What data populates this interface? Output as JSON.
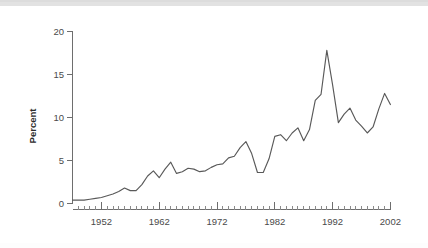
{
  "figure": {
    "background_color": "#ffffff",
    "top_strip_color": "#e2e2e2",
    "line_color": "#595959",
    "axis_color": "#6e6e6e",
    "text_color": "#4a4a4a"
  },
  "axis": {
    "ylabel": "Percent",
    "yticks": [
      "0",
      "5",
      "10",
      "15",
      "20"
    ],
    "xticks": [
      "1952",
      "1962",
      "1972",
      "1982",
      "1992",
      "2002"
    ]
  },
  "chart_data": {
    "type": "line",
    "title": "",
    "xlabel": "",
    "ylabel": "Percent",
    "xlim": [
      1947,
      2002
    ],
    "ylim": [
      0,
      20
    ],
    "yticks": [
      0,
      5,
      10,
      15,
      20
    ],
    "xticks": [
      1952,
      1962,
      1972,
      1982,
      1992,
      2002
    ],
    "minor_xtick_interval": 1,
    "grid": false,
    "legend": "none",
    "x": [
      1947,
      1948,
      1949,
      1950,
      1951,
      1952,
      1953,
      1954,
      1955,
      1956,
      1957,
      1958,
      1959,
      1960,
      1961,
      1962,
      1963,
      1964,
      1965,
      1966,
      1967,
      1968,
      1969,
      1970,
      1971,
      1972,
      1973,
      1974,
      1975,
      1976,
      1977,
      1978,
      1979,
      1980,
      1981,
      1982,
      1983,
      1984,
      1985,
      1986,
      1987,
      1988,
      1989,
      1990,
      1991,
      1992,
      1993,
      1994,
      1995,
      1996,
      1997,
      1998,
      1999,
      2000,
      2001,
      2002
    ],
    "values": [
      0.4,
      0.4,
      0.4,
      0.5,
      0.6,
      0.7,
      0.9,
      1.1,
      1.4,
      1.8,
      1.5,
      1.5,
      2.2,
      3.2,
      3.8,
      3.0,
      4.0,
      4.8,
      3.5,
      3.7,
      4.1,
      4.0,
      3.7,
      3.8,
      4.2,
      4.5,
      4.6,
      5.3,
      5.5,
      6.5,
      7.2,
      5.8,
      3.6,
      3.6,
      5.2,
      7.8,
      8.0,
      7.3,
      8.2,
      8.8,
      7.3,
      8.6,
      12.0,
      12.7,
      17.8,
      13.8,
      9.4,
      10.4,
      11.1,
      9.7,
      9.0,
      8.2,
      8.9,
      11.0,
      12.8,
      11.5
    ],
    "series": [
      {
        "name": "Percent",
        "points": [
          {
            "x": 1947,
            "y": 0.4
          },
          {
            "x": 1948,
            "y": 0.4
          },
          {
            "x": 1949,
            "y": 0.4
          },
          {
            "x": 1950,
            "y": 0.5
          },
          {
            "x": 1951,
            "y": 0.6
          },
          {
            "x": 1952,
            "y": 0.7
          },
          {
            "x": 1953,
            "y": 0.9
          },
          {
            "x": 1954,
            "y": 1.1
          },
          {
            "x": 1955,
            "y": 1.4
          },
          {
            "x": 1956,
            "y": 1.8
          },
          {
            "x": 1957,
            "y": 1.5
          },
          {
            "x": 1958,
            "y": 1.5
          },
          {
            "x": 1959,
            "y": 2.2
          },
          {
            "x": 1960,
            "y": 3.2
          },
          {
            "x": 1961,
            "y": 3.8
          },
          {
            "x": 1962,
            "y": 3.0
          },
          {
            "x": 1963,
            "y": 4.0
          },
          {
            "x": 1964,
            "y": 4.8
          },
          {
            "x": 1965,
            "y": 3.5
          },
          {
            "x": 1966,
            "y": 3.7
          },
          {
            "x": 1967,
            "y": 4.1
          },
          {
            "x": 1968,
            "y": 4.0
          },
          {
            "x": 1969,
            "y": 3.7
          },
          {
            "x": 1970,
            "y": 3.8
          },
          {
            "x": 1971,
            "y": 4.2
          },
          {
            "x": 1972,
            "y": 4.5
          },
          {
            "x": 1973,
            "y": 4.6
          },
          {
            "x": 1974,
            "y": 5.3
          },
          {
            "x": 1975,
            "y": 5.5
          },
          {
            "x": 1976,
            "y": 6.5
          },
          {
            "x": 1977,
            "y": 7.2
          },
          {
            "x": 1978,
            "y": 5.8
          },
          {
            "x": 1979,
            "y": 3.6
          },
          {
            "x": 1980,
            "y": 3.6
          },
          {
            "x": 1981,
            "y": 5.2
          },
          {
            "x": 1982,
            "y": 7.8
          },
          {
            "x": 1983,
            "y": 8.0
          },
          {
            "x": 1984,
            "y": 7.3
          },
          {
            "x": 1985,
            "y": 8.2
          },
          {
            "x": 1986,
            "y": 8.8
          },
          {
            "x": 1987,
            "y": 7.3
          },
          {
            "x": 1988,
            "y": 8.6
          },
          {
            "x": 1989,
            "y": 12.0
          },
          {
            "x": 1990,
            "y": 12.7
          },
          {
            "x": 1991,
            "y": 17.8
          },
          {
            "x": 1992,
            "y": 13.8
          },
          {
            "x": 1993,
            "y": 9.4
          },
          {
            "x": 1994,
            "y": 10.4
          },
          {
            "x": 1995,
            "y": 11.1
          },
          {
            "x": 1996,
            "y": 9.7
          },
          {
            "x": 1997,
            "y": 9.0
          },
          {
            "x": 1998,
            "y": 8.2
          },
          {
            "x": 1999,
            "y": 8.9
          },
          {
            "x": 2000,
            "y": 11.0
          },
          {
            "x": 2001,
            "y": 12.8
          },
          {
            "x": 2002,
            "y": 11.5
          }
        ]
      }
    ],
    "annotations": []
  }
}
